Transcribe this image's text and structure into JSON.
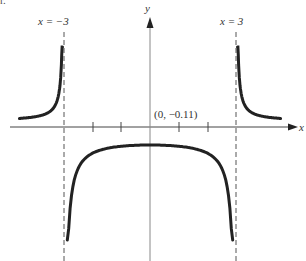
{
  "chart_data": {
    "type": "line",
    "title": "",
    "function": "1/(x^2 - 9)",
    "xlabel": "x",
    "ylabel": "y",
    "xlim": [
      -5,
      5
    ],
    "ylim": [
      -4.5,
      4
    ],
    "grid": false,
    "x_ticks": [
      -2,
      -1,
      1,
      2
    ],
    "asymptotes": [
      {
        "label_var": "x",
        "label_eq": "= −3",
        "x": -3
      },
      {
        "label_var": "x",
        "label_eq": "= 3",
        "x": 3
      }
    ],
    "annotations": [
      {
        "text": "(0, −0.11)",
        "x": 0,
        "y": -0.11
      }
    ],
    "series": [
      {
        "name": "left branch",
        "x_range": [
          -4.8,
          -3.05
        ],
        "shape": "positive, rising toward +∞ at x=−3"
      },
      {
        "name": "middle branch",
        "x_range": [
          -2.95,
          2.95
        ],
        "shape": "negative, max at (0, −0.11), falling toward −∞ at x=±3"
      },
      {
        "name": "right branch",
        "x_range": [
          3.05,
          4.8
        ],
        "shape": "positive, decaying from +∞ at x=3"
      }
    ]
  },
  "labels": {
    "corner": "r.",
    "x_axis": "x",
    "y_axis": "y",
    "asym_left": "x = −3",
    "asym_right": "x = 3",
    "intercept": "(0, −0.11)"
  }
}
